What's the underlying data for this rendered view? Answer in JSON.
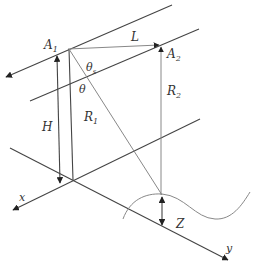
{
  "diagram": {
    "type": "geometry-schematic",
    "labels": {
      "A1": "A",
      "A1_sub": "1",
      "A2": "A",
      "A2_sub": "2",
      "L": "L",
      "theta_s": "θ",
      "theta_s_sub": "s",
      "theta": "θ",
      "R1": "R",
      "R1_sub": "1",
      "R2": "R",
      "R2_sub": "2",
      "H": "H",
      "Z": "Z",
      "x": "x",
      "y": "y"
    },
    "elements": [
      {
        "name": "top-line",
        "description": "line through A1 with arrow toward lower-left"
      },
      {
        "name": "middle-line",
        "description": "line through A2 parallel to top-line"
      },
      {
        "name": "x-axis",
        "description": "axis with arrow toward lower-left labeled x"
      },
      {
        "name": "y-axis",
        "description": "axis with arrow toward lower-right labeled y"
      },
      {
        "name": "L-arrow",
        "description": "horizontal arrow from A1 to A2"
      },
      {
        "name": "H-arrow",
        "description": "double-headed vertical arrow height H"
      },
      {
        "name": "R1-line",
        "description": "slant line from A1 to terrain point"
      },
      {
        "name": "R2-arrow",
        "description": "vertical arrow from terrain to A2"
      },
      {
        "name": "Z-arrow",
        "description": "double-headed arrow between terrain and y-axis"
      },
      {
        "name": "terrain-curve",
        "description": "wavy surface curve"
      }
    ]
  }
}
